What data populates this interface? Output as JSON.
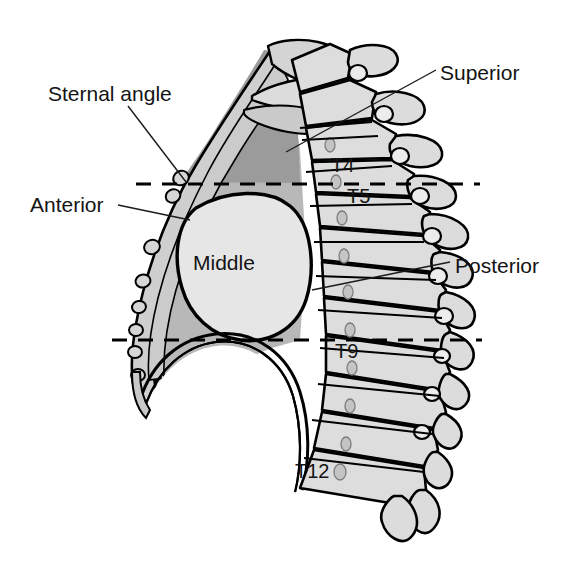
{
  "figure": {
    "view": "lateral (sagittal) view, anterior to the left, posterior to the right",
    "background_color": "#ffffff",
    "ink_color": "#000000"
  },
  "labels": {
    "sternal_angle": "Sternal angle",
    "anterior": "Anterior",
    "middle": "Middle",
    "superior": "Superior",
    "posterior": "Posterior"
  },
  "vertebrae": {
    "t4": "T4",
    "t5": "T5",
    "t9": "T9",
    "t12": "T12"
  },
  "palette": {
    "superior_mediastinum_fill": "#9b9b9b",
    "posterior_mediastinum_fill": "#b8b8b8",
    "anterior_strip_fill": "#cfcfcf",
    "middle_mediastinum_fill": "#e3e3e3",
    "bone_fill": "#d8d8d8",
    "bone_fill_light": "#e6e6e6",
    "line": "#000000",
    "text": "#141414"
  },
  "reference_lines": {
    "upper_label": "sternal angle plane (T4/T5 disc level)",
    "lower_label": "lower mediastinal boundary (T9 level)"
  }
}
